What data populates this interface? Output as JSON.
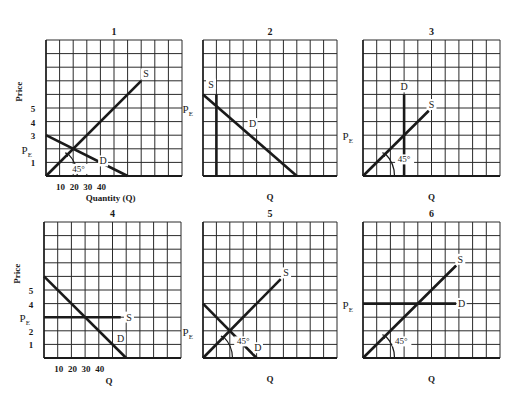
{
  "figure": {
    "ink_color": "#1a1a1a",
    "grid_color": "#2a2a2a",
    "background": "#ffffff"
  },
  "chart_data": [
    {
      "id": "1",
      "type": "line",
      "title": "1",
      "ylabel": "Price",
      "xlabel": "Quantity (Q)",
      "y_ticks": [
        "5",
        "4",
        "3",
        "PE",
        "1"
      ],
      "y_tick_values": [
        5,
        4,
        3,
        2,
        1
      ],
      "x_ticks": [
        "10",
        "20",
        "30",
        "40"
      ],
      "x_tick_values": [
        1,
        2,
        3,
        4
      ],
      "grid": true,
      "grid_cells": [
        10,
        10
      ],
      "xlim": [
        0,
        10
      ],
      "ylim": [
        0,
        10
      ],
      "series": [
        {
          "name": "S",
          "points": [
            [
              0,
              0
            ],
            [
              7,
              7
            ]
          ]
        },
        {
          "name": "D",
          "points": [
            [
              0,
              3
            ],
            [
              6,
              0
            ]
          ]
        }
      ],
      "annotations": [
        {
          "text": "45°",
          "at": [
            2.4,
            0.3
          ]
        },
        {
          "text": "PE",
          "at": [
            -1,
            2
          ]
        }
      ],
      "equilibrium": [
        2,
        2
      ]
    },
    {
      "id": "2",
      "type": "line",
      "title": "2",
      "ylabel": "",
      "xlabel": "Q",
      "y_ticks": [
        "PE"
      ],
      "y_tick_values": [
        5
      ],
      "grid": true,
      "grid_cells": [
        10,
        10
      ],
      "xlim": [
        0,
        10
      ],
      "ylim": [
        0,
        10
      ],
      "series": [
        {
          "name": "S",
          "points": [
            [
              1,
              0
            ],
            [
              1,
              6
            ]
          ]
        },
        {
          "name": "D",
          "points": [
            [
              0,
              6
            ],
            [
              7,
              0
            ]
          ]
        }
      ],
      "annotations": [],
      "equilibrium": [
        1,
        5.1
      ]
    },
    {
      "id": "3",
      "type": "line",
      "title": "3",
      "ylabel": "",
      "xlabel": "Q",
      "y_ticks": [
        "PE"
      ],
      "y_tick_values": [
        3
      ],
      "grid": true,
      "grid_cells": [
        10,
        10
      ],
      "xlim": [
        0,
        10
      ],
      "ylim": [
        0,
        10
      ],
      "series": [
        {
          "name": "S",
          "points": [
            [
              0,
              0
            ],
            [
              4.8,
              4.8
            ]
          ]
        },
        {
          "name": "D",
          "points": [
            [
              3,
              0
            ],
            [
              3,
              6
            ]
          ]
        }
      ],
      "annotations": [
        {
          "text": "45°",
          "at": [
            3,
            1
          ]
        }
      ],
      "equilibrium": [
        3,
        3
      ]
    },
    {
      "id": "4",
      "type": "line",
      "title": "4",
      "ylabel": "Price",
      "xlabel": "Q",
      "y_ticks": [
        "5",
        "4",
        "PE",
        "2",
        "1"
      ],
      "y_tick_values": [
        5,
        4,
        3,
        2,
        1
      ],
      "x_ticks": [
        "10",
        "20",
        "30",
        "40"
      ],
      "x_tick_values": [
        1,
        2,
        3,
        4
      ],
      "grid": true,
      "grid_cells": [
        10,
        10
      ],
      "xlim": [
        0,
        10
      ],
      "ylim": [
        0,
        10
      ],
      "series": [
        {
          "name": "S",
          "points": [
            [
              0,
              3
            ],
            [
              5.6,
              3
            ]
          ]
        },
        {
          "name": "D",
          "points": [
            [
              0,
              6
            ],
            [
              6,
              0
            ]
          ]
        }
      ],
      "annotations": [],
      "equilibrium": [
        3,
        3
      ]
    },
    {
      "id": "5",
      "type": "line",
      "title": "5",
      "ylabel": "",
      "xlabel": "Q",
      "y_ticks": [
        "PE"
      ],
      "y_tick_values": [
        2
      ],
      "grid": true,
      "grid_cells": [
        10,
        10
      ],
      "xlim": [
        0,
        10
      ],
      "ylim": [
        0,
        10
      ],
      "series": [
        {
          "name": "S",
          "points": [
            [
              0,
              0
            ],
            [
              5.8,
              5.8
            ]
          ]
        },
        {
          "name": "D",
          "points": [
            [
              0,
              4
            ],
            [
              4,
              0
            ]
          ]
        }
      ],
      "annotations": [
        {
          "text": "45°",
          "at": [
            3,
            1
          ]
        }
      ],
      "equilibrium": [
        2,
        2
      ]
    },
    {
      "id": "6",
      "type": "line",
      "title": "6",
      "ylabel": "",
      "xlabel": "Q",
      "y_ticks": [
        "PE"
      ],
      "y_tick_values": [
        4
      ],
      "grid": true,
      "grid_cells": [
        10,
        10
      ],
      "xlim": [
        0,
        10
      ],
      "ylim": [
        0,
        10
      ],
      "series": [
        {
          "name": "S",
          "points": [
            [
              0,
              0
            ],
            [
              6.8,
              6.8
            ]
          ]
        },
        {
          "name": "D",
          "points": [
            [
              0,
              4
            ],
            [
              6.8,
              4
            ]
          ]
        }
      ],
      "annotations": [
        {
          "text": "45°",
          "at": [
            2.8,
            1
          ]
        }
      ],
      "equilibrium": [
        4,
        4
      ]
    }
  ],
  "labels": {
    "price": "Price",
    "pe_main": "P",
    "pe_sub": "E",
    "supply": "S",
    "demand": "D",
    "angle": "45°",
    "quantity_full": "Quantity (Q)",
    "quantity_short": "Q"
  }
}
